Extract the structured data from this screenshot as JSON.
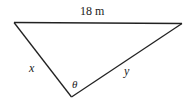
{
  "diagram": {
    "type": "triangle",
    "top_side_label": "18 m",
    "left_side_label": "x",
    "right_side_label": "y",
    "angle_label": "θ",
    "line_color": "#222222"
  }
}
